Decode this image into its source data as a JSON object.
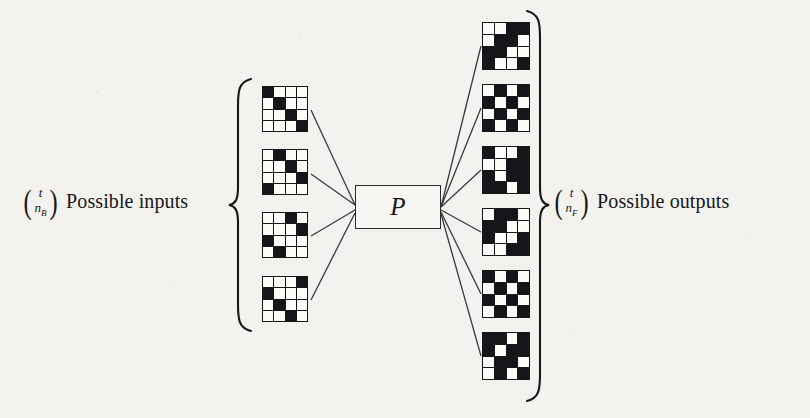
{
  "figure": {
    "caption_left": "Possible inputs",
    "caption_right": "Possible outputs",
    "center_box_label": "P",
    "ink_color": "#15151a",
    "paper_color": "#f3f2ee"
  },
  "left_binomial": {
    "open_paren": "(",
    "close_paren": ")",
    "top": "t",
    "bottom_base": "n",
    "bottom_sub": "B"
  },
  "right_binomial": {
    "open_paren": "(",
    "close_paren": ")",
    "top": "t",
    "bottom_base": "n",
    "bottom_sub": "F"
  },
  "braces": {
    "left": "{",
    "right": "}"
  },
  "inputs": {
    "count": 4,
    "grid_size": 4,
    "items": [
      {
        "name": "input-grid-1",
        "x": 262,
        "y": 86,
        "cells": [
          [
            1,
            0,
            0,
            0
          ],
          [
            0,
            1,
            0,
            0
          ],
          [
            0,
            0,
            1,
            0
          ],
          [
            0,
            0,
            0,
            1
          ]
        ]
      },
      {
        "name": "input-grid-2",
        "x": 262,
        "y": 149,
        "cells": [
          [
            0,
            1,
            0,
            0
          ],
          [
            0,
            0,
            1,
            0
          ],
          [
            0,
            0,
            0,
            1
          ],
          [
            1,
            0,
            0,
            0
          ]
        ]
      },
      {
        "name": "input-grid-3",
        "x": 262,
        "y": 212,
        "cells": [
          [
            0,
            0,
            1,
            0
          ],
          [
            0,
            0,
            0,
            1
          ],
          [
            1,
            0,
            0,
            0
          ],
          [
            0,
            1,
            0,
            0
          ]
        ]
      },
      {
        "name": "input-grid-4",
        "x": 262,
        "y": 276,
        "cells": [
          [
            0,
            0,
            0,
            1
          ],
          [
            1,
            0,
            0,
            0
          ],
          [
            0,
            1,
            0,
            0
          ],
          [
            0,
            0,
            1,
            0
          ]
        ]
      }
    ]
  },
  "outputs": {
    "count": 6,
    "grid_size": 4,
    "items": [
      {
        "name": "output-grid-1",
        "x": 482,
        "y": 22,
        "cells": [
          [
            0,
            0,
            1,
            1
          ],
          [
            0,
            1,
            1,
            0
          ],
          [
            1,
            1,
            0,
            0
          ],
          [
            1,
            0,
            0,
            1
          ]
        ]
      },
      {
        "name": "output-grid-2",
        "x": 482,
        "y": 84,
        "cells": [
          [
            0,
            1,
            0,
            1
          ],
          [
            1,
            0,
            1,
            0
          ],
          [
            0,
            1,
            0,
            1
          ],
          [
            1,
            0,
            1,
            0
          ]
        ]
      },
      {
        "name": "output-grid-3",
        "x": 482,
        "y": 146,
        "cells": [
          [
            1,
            0,
            0,
            1
          ],
          [
            0,
            0,
            1,
            1
          ],
          [
            1,
            0,
            1,
            1
          ],
          [
            1,
            1,
            0,
            1
          ]
        ]
      },
      {
        "name": "output-grid-4",
        "x": 482,
        "y": 208,
        "cells": [
          [
            0,
            1,
            1,
            0
          ],
          [
            1,
            1,
            0,
            0
          ],
          [
            1,
            0,
            0,
            1
          ],
          [
            0,
            0,
            1,
            1
          ]
        ]
      },
      {
        "name": "output-grid-5",
        "x": 482,
        "y": 270,
        "cells": [
          [
            1,
            0,
            1,
            0
          ],
          [
            0,
            1,
            0,
            1
          ],
          [
            1,
            0,
            1,
            0
          ],
          [
            0,
            1,
            0,
            1
          ]
        ]
      },
      {
        "name": "output-grid-6",
        "x": 482,
        "y": 332,
        "cells": [
          [
            1,
            1,
            0,
            1
          ],
          [
            1,
            0,
            1,
            1
          ],
          [
            0,
            1,
            1,
            0
          ],
          [
            0,
            1,
            0,
            1
          ]
        ]
      }
    ]
  },
  "connectors": {
    "stroke": "#3a3a3e",
    "left_edges": [
      {
        "name": "wire-input-1",
        "x1": 311,
        "y1": 110,
        "x2": 355,
        "y2": 205
      },
      {
        "name": "wire-input-2",
        "x1": 311,
        "y1": 174,
        "x2": 355,
        "y2": 205
      },
      {
        "name": "wire-input-3",
        "x1": 311,
        "y1": 236,
        "x2": 355,
        "y2": 210
      },
      {
        "name": "wire-input-4",
        "x1": 311,
        "y1": 300,
        "x2": 355,
        "y2": 213
      }
    ],
    "right_edges": [
      {
        "name": "wire-output-1",
        "x1": 441,
        "y1": 207,
        "x2": 481,
        "y2": 46
      },
      {
        "name": "wire-output-2",
        "x1": 441,
        "y1": 207,
        "x2": 481,
        "y2": 108
      },
      {
        "name": "wire-output-3",
        "x1": 441,
        "y1": 207,
        "x2": 481,
        "y2": 170
      },
      {
        "name": "wire-output-4",
        "x1": 441,
        "y1": 210,
        "x2": 481,
        "y2": 232
      },
      {
        "name": "wire-output-5",
        "x1": 441,
        "y1": 212,
        "x2": 481,
        "y2": 294
      },
      {
        "name": "wire-output-6",
        "x1": 441,
        "y1": 214,
        "x2": 481,
        "y2": 356
      }
    ]
  }
}
